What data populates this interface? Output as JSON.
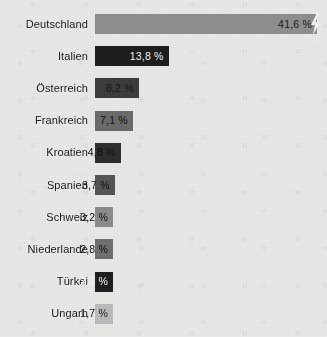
{
  "chart_data": {
    "type": "bar",
    "title": "",
    "subtitle": "",
    "xlabel": "",
    "ylabel": "",
    "orientation": "horizontal",
    "grid": false,
    "legend": false,
    "value_suffix": "%",
    "xlim": [
      0,
      41.6
    ],
    "categories": [
      "Deutschland",
      "Italien",
      "Österreich",
      "Frankreich",
      "Kroatien",
      "Spanien",
      "Schweiz",
      "Niederlande",
      "Türkei",
      "Ungarn"
    ],
    "values": [
      41.6,
      13.8,
      8.2,
      7.1,
      4.8,
      3.7,
      3.2,
      2.8,
      2.2,
      1.7
    ],
    "value_labels": [
      "41,6 %",
      "13,8 %",
      "8,2 %",
      "7,1 %",
      "4,8 %",
      "3,7 %",
      "3,2 %",
      "2,8 %",
      "2,2 %",
      "1,7 %"
    ],
    "bar_colors": [
      "#8d8d8d",
      "#1d1d1d",
      "#3c3c3c",
      "#6a6a6a",
      "#2e2e2e",
      "#555555",
      "#8a8a8a",
      "#6e6e6e",
      "#1f1f1f",
      "#b9b9b9"
    ],
    "value_text_colors": [
      "#1b1b1b",
      "#f0f0f0",
      "#151515",
      "#111111",
      "#0d0d0d",
      "#111111",
      "#111111",
      "#111111",
      "#f2f2f2",
      "#1b1b1b"
    ],
    "marker": {
      "name": "lightning-bolt",
      "category": "Deutschland",
      "color": "#f2f2ef"
    },
    "background_color": "#e9e9e7",
    "label_color": "#1b1b1b"
  }
}
